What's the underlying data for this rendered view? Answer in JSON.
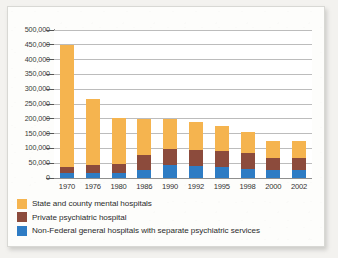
{
  "chart_data": {
    "type": "bar",
    "stacked": true,
    "title": "",
    "xlabel": "",
    "ylabel": "",
    "ylim": [
      0,
      500000
    ],
    "ytick_values": [
      0,
      50000,
      100000,
      150000,
      200000,
      250000,
      300000,
      350000,
      400000,
      450000,
      500000
    ],
    "ytick_labels": [
      "0",
      "50,000",
      "100,000",
      "150,000",
      "200,000",
      "250,000",
      "300,000",
      "350,000",
      "400,000",
      "450,000",
      "500,000"
    ],
    "grid": true,
    "legend_position": "below",
    "categories": [
      "1970",
      "1976",
      "1980",
      "1986",
      "1990",
      "1992",
      "1995",
      "1998",
      "2000",
      "2002"
    ],
    "series": [
      {
        "name": "Non-Federal general hospitals with separate psychiatric services",
        "color": "#2e7cc4",
        "values": [
          16000,
          18000,
          18000,
          26000,
          45000,
          40000,
          38000,
          31000,
          27000,
          26000
        ]
      },
      {
        "name": "Private psychiatric hospital",
        "color": "#8c4b3c",
        "values": [
          22000,
          27000,
          28000,
          52000,
          53000,
          53000,
          54000,
          54000,
          39000,
          40000
        ]
      },
      {
        "name": "State and county mental hospitals",
        "color": "#f5b44f",
        "values": [
          413000,
          222000,
          156000,
          121000,
          101000,
          96000,
          85000,
          72000,
          58000,
          58000
        ]
      }
    ],
    "totals": [
      451000,
      267000,
      202000,
      199000,
      199000,
      189000,
      177000,
      157000,
      124000,
      124000
    ]
  },
  "legend": {
    "items": [
      {
        "label": "State and county mental hospitals",
        "color": "#f5b44f"
      },
      {
        "label": "Private psychiatric hospital",
        "color": "#8c4b3c"
      },
      {
        "label": "Non-Federal general hospitals with separate psychiatric services",
        "color": "#2e7cc4"
      }
    ]
  }
}
